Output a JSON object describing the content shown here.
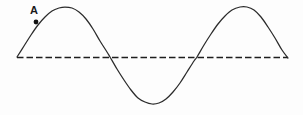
{
  "figure": {
    "background_color": "#fdfdfd",
    "curve_color": "#2b2b2b",
    "baseline_color": "#1e1e1e",
    "marker_color": "#121212"
  },
  "labels": {
    "point_a": "A"
  },
  "chart_data": {
    "type": "line",
    "title": "",
    "xlabel": "",
    "ylabel": "",
    "grid": false,
    "legend": null,
    "xlim": [
      17,
      288
    ],
    "ylim": [
      104,
      8
    ],
    "series": [
      {
        "name": "wave",
        "description": "sine wave, 1.5 cycles, drawn left to right",
        "points": [
          [
            17,
            57
          ],
          [
            24,
            46
          ],
          [
            31,
            35
          ],
          [
            38,
            25
          ],
          [
            45,
            17
          ],
          [
            52,
            11
          ],
          [
            59,
            8
          ],
          [
            65,
            7
          ],
          [
            72,
            8
          ],
          [
            79,
            12
          ],
          [
            86,
            19
          ],
          [
            93,
            29
          ],
          [
            100,
            41
          ],
          [
            107,
            52
          ],
          [
            110,
            57
          ],
          [
            117,
            69
          ],
          [
            124,
            80
          ],
          [
            131,
            90
          ],
          [
            138,
            98
          ],
          [
            145,
            102
          ],
          [
            152,
            104
          ],
          [
            159,
            103
          ],
          [
            166,
            99
          ],
          [
            173,
            92
          ],
          [
            180,
            83
          ],
          [
            187,
            72
          ],
          [
            194,
            61
          ],
          [
            197,
            57
          ],
          [
            204,
            45
          ],
          [
            211,
            34
          ],
          [
            218,
            24
          ],
          [
            225,
            16
          ],
          [
            232,
            10
          ],
          [
            240,
            7
          ],
          [
            247,
            7
          ],
          [
            254,
            10
          ],
          [
            261,
            17
          ],
          [
            268,
            27
          ],
          [
            275,
            38
          ],
          [
            282,
            50
          ],
          [
            288,
            58
          ]
        ]
      },
      {
        "name": "equilibrium",
        "description": "dashed horizontal rest-position axis",
        "points": [
          [
            17,
            57
          ],
          [
            288,
            57
          ]
        ]
      }
    ],
    "annotations": [
      {
        "label": "A",
        "marker_x": 36,
        "marker_y": 22,
        "text_x": 30,
        "text_y": 14,
        "marker_shape": "filled-dot",
        "marker_radius": 2.4
      }
    ]
  }
}
